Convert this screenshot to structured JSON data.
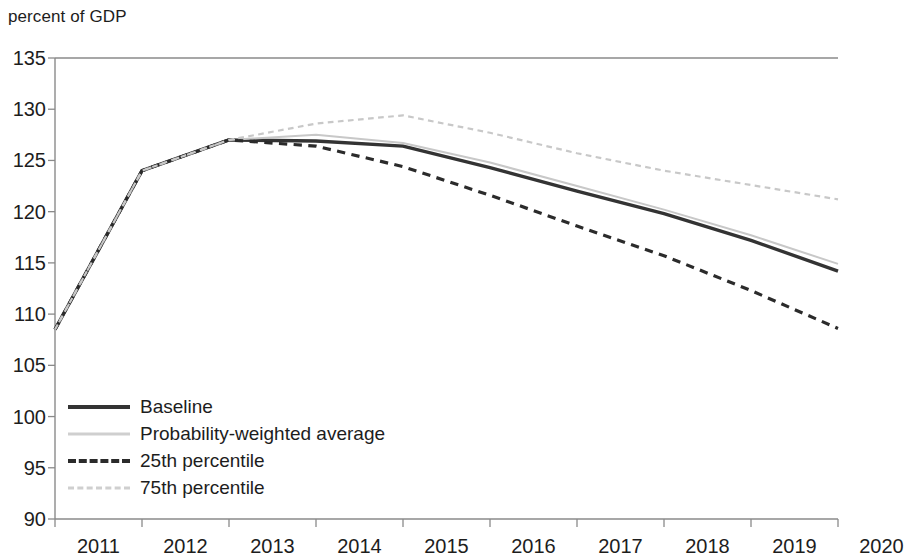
{
  "chart_data": {
    "type": "line",
    "title": "percent of GDP",
    "xlabel": "",
    "ylabel": "percent of GDP",
    "grid": false,
    "legend_position": "inside-bottom-left",
    "x": [
      2011,
      2012,
      2013,
      2014,
      2015,
      2016,
      2017,
      2018,
      2019,
      2020
    ],
    "xlim": [
      2011,
      2020
    ],
    "ylim": [
      90,
      135
    ],
    "yticks": [
      90,
      95,
      100,
      105,
      110,
      115,
      120,
      125,
      130,
      135
    ],
    "xticks": [
      2011,
      2012,
      2013,
      2014,
      2015,
      2016,
      2017,
      2018,
      2019,
      2020
    ],
    "series": [
      {
        "name": "Baseline",
        "style": "solid",
        "color": "#333333",
        "width": 3.4,
        "values": [
          108.5,
          124.0,
          127.0,
          126.9,
          126.4,
          124.3,
          122.0,
          119.8,
          117.2,
          114.2
        ]
      },
      {
        "name": "Probability-weighted average",
        "style": "solid",
        "color": "#c8c8c8",
        "width": 2.0,
        "values": [
          108.5,
          124.0,
          127.0,
          127.5,
          126.7,
          124.8,
          122.5,
          120.2,
          117.7,
          114.9
        ]
      },
      {
        "name": "25th percentile",
        "style": "dashed",
        "color": "#2b2b2b",
        "width": 3.2,
        "values": [
          108.5,
          124.0,
          127.0,
          126.4,
          124.4,
          121.6,
          118.6,
          115.7,
          112.3,
          108.6
        ]
      },
      {
        "name": "75th percentile",
        "style": "dashed",
        "color": "#c8c8c8",
        "width": 2.2,
        "values": [
          108.5,
          124.0,
          127.0,
          128.6,
          129.4,
          127.7,
          125.7,
          124.0,
          122.6,
          121.2
        ]
      }
    ]
  },
  "axis": {
    "title": "percent of GDP",
    "y_labels": [
      "135",
      "130",
      "125",
      "120",
      "115",
      "110",
      "105",
      "100",
      "95",
      "90"
    ],
    "x_labels": [
      "2011",
      "2012",
      "2013",
      "2014",
      "2015",
      "2016",
      "2017",
      "2018",
      "2019",
      "2020"
    ]
  },
  "legend": {
    "items": [
      {
        "label": "Baseline"
      },
      {
        "label": "Probability-weighted average"
      },
      {
        "label": "25th percentile"
      },
      {
        "label": "75th percentile"
      }
    ]
  },
  "colors": {
    "baseline": "#333333",
    "probability_weighted_average": "#c8c8c8",
    "percentile_25": "#2b2b2b",
    "percentile_75": "#c8c8c8",
    "axis": "#8a8a8a",
    "text": "#1d1d1d"
  }
}
